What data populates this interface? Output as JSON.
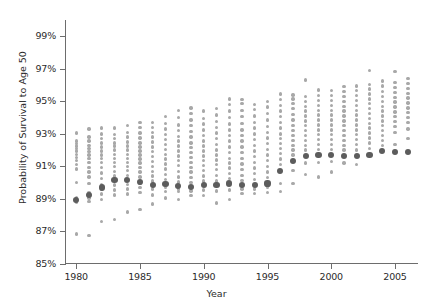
{
  "chart_data": {
    "type": "scatter",
    "title": "",
    "xlabel": "Year",
    "ylabel": "Probability of Survival to Age 50",
    "xlim": [
      1979.2,
      2006.8
    ],
    "ylim": [
      85,
      100
    ],
    "grid": false,
    "legend": null,
    "x_ticks": [
      1980,
      1985,
      1990,
      1995,
      2000,
      2005
    ],
    "x_tick_labels": [
      "1980",
      "1985",
      "1990",
      "1995",
      "2000",
      "2005"
    ],
    "y_ticks": [
      85,
      87,
      89,
      91,
      93,
      95,
      97,
      99
    ],
    "y_tick_labels": [
      "85%",
      "87%",
      "89%",
      "91%",
      "93%",
      "95%",
      "97%",
      "99%"
    ],
    "series": [
      {
        "name": "median",
        "color": "#5c5c5c",
        "marker": "large-dot",
        "points": [
          [
            1980,
            88.95
          ],
          [
            1981,
            89.25
          ],
          [
            1982,
            89.7
          ],
          [
            1983,
            90.15
          ],
          [
            1984,
            90.15
          ],
          [
            1985,
            90.05
          ],
          [
            1986,
            89.85
          ],
          [
            1987,
            89.9
          ],
          [
            1988,
            89.8
          ],
          [
            1989,
            89.75
          ],
          [
            1990,
            89.85
          ],
          [
            1991,
            89.85
          ],
          [
            1992,
            89.95
          ],
          [
            1993,
            89.85
          ],
          [
            1994,
            89.85
          ],
          [
            1995,
            89.95
          ],
          [
            1996,
            90.7
          ],
          [
            1997,
            91.35
          ],
          [
            1998,
            91.65
          ],
          [
            1999,
            91.7
          ],
          [
            2000,
            91.7
          ],
          [
            2001,
            91.65
          ],
          [
            2002,
            91.65
          ],
          [
            2003,
            91.7
          ],
          [
            2004,
            91.95
          ],
          [
            2005,
            91.9
          ],
          [
            2006,
            91.9
          ]
        ]
      },
      {
        "name": "observations",
        "color": "#a8a8a8",
        "marker": "small-dot",
        "points_by_year": {
          "1980": [
            86.85,
            88.8,
            88.85,
            88.95,
            89.0,
            89.1,
            90.0,
            90.85,
            91.1,
            91.35,
            91.55,
            91.75,
            91.95,
            92.1,
            92.25,
            92.4,
            92.55,
            93.05
          ],
          "1981": [
            86.75,
            88.85,
            89.05,
            89.2,
            89.25,
            89.4,
            89.95,
            90.35,
            90.65,
            90.95,
            91.25,
            91.5,
            91.7,
            91.9,
            92.1,
            92.3,
            92.55,
            92.8,
            93.3
          ],
          "1982": [
            87.6,
            88.95,
            89.3,
            89.6,
            89.7,
            89.9,
            90.25,
            90.6,
            90.95,
            91.25,
            91.5,
            91.7,
            91.95,
            92.2,
            92.45,
            92.7,
            93.0,
            93.35
          ],
          "1983": [
            87.75,
            89.25,
            89.55,
            89.85,
            90.15,
            90.4,
            90.7,
            91.0,
            91.25,
            91.5,
            91.75,
            92.0,
            92.25,
            92.45,
            92.7,
            92.95,
            93.35
          ],
          "1984": [
            88.2,
            89.3,
            89.6,
            89.9,
            90.15,
            90.45,
            90.75,
            91.0,
            91.25,
            91.5,
            91.75,
            92.0,
            92.25,
            92.5,
            92.8,
            93.1,
            93.5
          ],
          "1985": [
            88.35,
            89.4,
            89.7,
            89.95,
            90.05,
            90.35,
            90.65,
            90.95,
            91.2,
            91.45,
            91.7,
            91.95,
            92.2,
            92.45,
            92.75,
            93.05,
            93.4,
            93.7
          ],
          "1986": [
            88.7,
            89.25,
            89.6,
            89.85,
            90.1,
            90.4,
            90.7,
            91.0,
            91.3,
            91.6,
            91.9,
            92.2,
            92.5,
            92.8,
            93.1,
            93.4,
            93.7
          ],
          "1987": [
            89.05,
            89.45,
            89.7,
            89.9,
            90.2,
            90.5,
            90.85,
            91.15,
            91.45,
            91.75,
            92.05,
            92.35,
            92.65,
            92.95,
            93.3,
            93.65,
            94.05
          ],
          "1988": [
            88.95,
            89.45,
            89.6,
            89.8,
            90.05,
            90.35,
            90.7,
            91.05,
            91.35,
            91.65,
            91.95,
            92.25,
            92.55,
            92.85,
            93.2,
            93.55,
            94.0,
            94.45
          ],
          "1989": [
            89.2,
            89.5,
            89.75,
            90.0,
            90.3,
            90.65,
            90.95,
            91.25,
            91.55,
            91.85,
            92.15,
            92.45,
            92.8,
            93.15,
            93.5,
            93.85,
            94.25,
            94.6
          ],
          "1990": [
            89.2,
            89.55,
            89.85,
            90.1,
            90.4,
            90.75,
            91.05,
            91.35,
            91.65,
            91.95,
            92.25,
            92.55,
            92.9,
            93.25,
            93.6,
            93.95,
            94.4
          ],
          "1991": [
            88.75,
            89.5,
            89.85,
            90.1,
            90.45,
            90.8,
            91.1,
            91.4,
            91.7,
            92.0,
            92.35,
            92.7,
            93.05,
            93.4,
            93.75,
            94.15,
            94.55
          ],
          "1992": [
            88.95,
            89.55,
            89.95,
            90.25,
            90.55,
            90.9,
            91.2,
            91.5,
            91.85,
            92.2,
            92.55,
            92.9,
            93.25,
            93.6,
            94.0,
            94.4,
            94.8,
            95.15
          ],
          "1993": [
            89.35,
            89.6,
            89.85,
            90.15,
            90.45,
            90.8,
            91.15,
            91.5,
            91.85,
            92.2,
            92.55,
            92.9,
            93.25,
            93.65,
            94.05,
            94.45,
            94.85,
            95.1
          ],
          "1994": [
            89.35,
            89.6,
            89.9,
            90.2,
            90.55,
            90.9,
            91.25,
            91.6,
            91.95,
            92.3,
            92.65,
            93.0,
            93.35,
            93.7,
            94.1,
            94.5,
            94.8
          ],
          "1995": [
            89.4,
            89.7,
            90.0,
            90.3,
            90.65,
            91.0,
            91.35,
            91.7,
            92.05,
            92.4,
            92.75,
            93.1,
            93.45,
            93.85,
            94.25,
            94.65,
            95.0
          ],
          "1996": [
            89.45,
            89.95,
            90.7,
            91.1,
            91.45,
            91.8,
            92.1,
            92.4,
            92.7,
            93.0,
            93.35,
            93.7,
            94.05,
            94.4,
            94.75,
            95.1,
            95.45
          ],
          "1997": [
            89.95,
            90.75,
            91.35,
            91.7,
            92.0,
            92.3,
            92.6,
            92.9,
            93.2,
            93.5,
            93.85,
            94.2,
            94.55,
            94.85,
            95.15,
            95.4
          ],
          "1998": [
            90.5,
            91.2,
            91.65,
            92.0,
            92.3,
            92.6,
            92.9,
            93.2,
            93.5,
            93.8,
            94.1,
            94.4,
            94.7,
            95.0,
            95.3,
            96.3
          ],
          "1999": [
            90.35,
            91.25,
            91.7,
            92.05,
            92.35,
            92.65,
            92.95,
            93.25,
            93.55,
            93.85,
            94.15,
            94.45,
            94.75,
            95.05,
            95.35,
            95.7
          ],
          "2000": [
            90.65,
            91.3,
            91.7,
            92.05,
            92.35,
            92.65,
            92.95,
            93.25,
            93.55,
            93.85,
            94.15,
            94.45,
            94.75,
            95.05,
            95.35,
            95.65
          ],
          "2001": [
            91.2,
            91.65,
            92.0,
            92.3,
            92.6,
            92.9,
            93.2,
            93.5,
            93.8,
            94.1,
            94.4,
            94.7,
            95.0,
            95.3,
            95.6,
            95.9
          ],
          "2002": [
            91.1,
            91.65,
            92.0,
            92.35,
            92.65,
            92.95,
            93.25,
            93.55,
            93.85,
            94.15,
            94.45,
            94.75,
            95.05,
            95.35,
            95.65,
            95.95
          ],
          "2003": [
            91.7,
            92.1,
            92.45,
            92.75,
            93.05,
            93.35,
            93.65,
            93.95,
            94.25,
            94.55,
            94.85,
            95.15,
            95.45,
            95.75,
            96.05,
            96.9
          ],
          "2004": [
            91.95,
            92.3,
            92.6,
            92.9,
            93.2,
            93.5,
            93.8,
            94.1,
            94.4,
            94.7,
            95.0,
            95.3,
            95.6,
            95.95,
            96.25
          ],
          "2005": [
            91.9,
            92.35,
            93.1,
            93.45,
            93.75,
            94.05,
            94.35,
            94.65,
            94.95,
            95.25,
            95.55,
            95.85,
            96.15,
            96.85
          ],
          "2006": [
            91.9,
            92.7,
            93.3,
            93.7,
            94.0,
            94.3,
            94.6,
            94.9,
            95.2,
            95.5,
            95.8,
            96.1,
            96.4
          ]
        }
      }
    ]
  },
  "colors": {
    "axis": "#6d6d6d",
    "text": "#2b2b2b",
    "observation_dot": "#a8a8a8",
    "median_dot": "#5c5c5c",
    "background": "#ffffff"
  }
}
